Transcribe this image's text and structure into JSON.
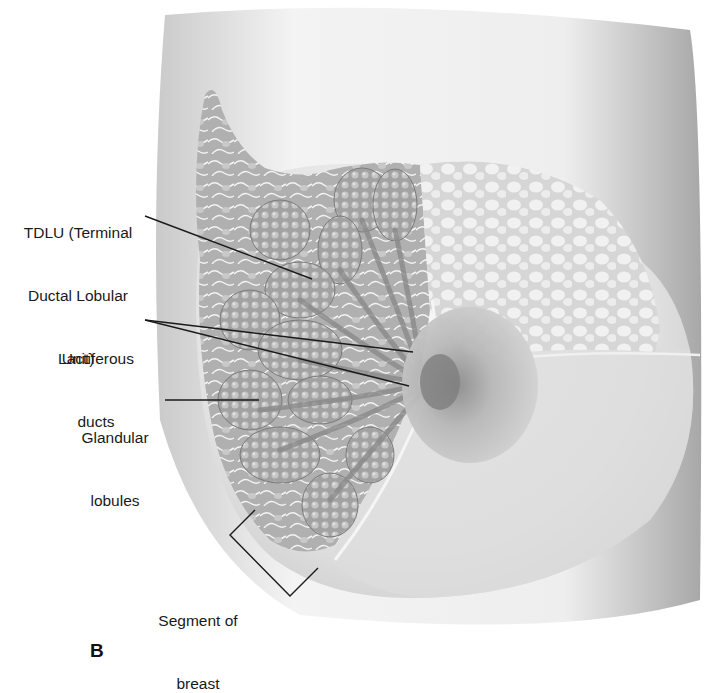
{
  "figure": {
    "panel_letter": "B",
    "labels": {
      "tdlu": {
        "line1": "TDLU (Terminal",
        "line2": "Ductal Lobular",
        "line3": "Unit)"
      },
      "lactiferous": {
        "line1": "Lactiferous",
        "line2": "ducts"
      },
      "glandular": {
        "line1": "Glandular",
        "line2": "lobules"
      },
      "segment": {
        "line1": "Segment of",
        "line2": "breast"
      }
    },
    "colors": {
      "background": "#ffffff",
      "skin_light": "#e9e9e9",
      "skin_shadow": "#b5b5b5",
      "lobule": "#a8a8a8",
      "fat": "#d8d8d8",
      "leader_line": "#1a1a1a"
    }
  }
}
